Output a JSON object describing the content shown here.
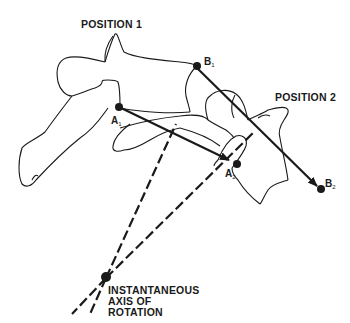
{
  "figure": {
    "labels": {
      "position1": "POSITION 1",
      "position2": "POSITION 2",
      "axis_line1": "INSTANTANEOUS",
      "axis_line2": "AXIS OF",
      "axis_line3": "ROTATION"
    },
    "points": {
      "A1": {
        "letter": "A",
        "sub": "1"
      },
      "A2": {
        "letter": "A",
        "sub": "2"
      },
      "B1": {
        "letter": "B",
        "sub": "1"
      },
      "B2": {
        "letter": "B",
        "sub": "2"
      }
    },
    "colors": {
      "ink": "#1a1a1a",
      "background": "#ffffff"
    }
  }
}
